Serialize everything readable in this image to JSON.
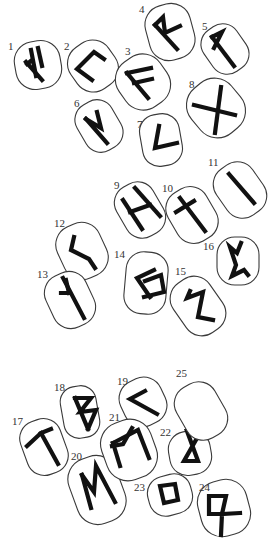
{
  "diagram": {
    "title": "",
    "colors": {
      "background": "#ffffff",
      "outline": "#3a3a3a",
      "rune": "#111111",
      "label": "#333333"
    },
    "stones": [
      {
        "number": "1",
        "rune": "ansuz-variant",
        "cx": 38,
        "cy": 65,
        "rx": 23,
        "ry": 24,
        "rot": -10,
        "label": {
          "x": 8,
          "y": 50
        },
        "paths": [
          "M26,62 L42,80",
          "M31,50 L36,76 M32,60 L27,64",
          "M38,48 L42,66"
        ]
      },
      {
        "number": "2",
        "rune": "uruz",
        "cx": 93,
        "cy": 66,
        "rx": 23,
        "ry": 25,
        "rot": -35,
        "label": {
          "x": 64,
          "y": 50
        },
        "paths": [
          "M104,59 L94,52 L77,69 L92,80"
        ]
      },
      {
        "number": "3",
        "rune": "ansuz",
        "cx": 143,
        "cy": 82,
        "rx": 25,
        "ry": 27,
        "rot": -35,
        "label": {
          "x": 125,
          "y": 55
        },
        "paths": [
          "M127,73 L148,98",
          "M127,73 L151,68",
          "M134,83 L152,79"
        ]
      },
      {
        "number": "4",
        "rune": "raidho",
        "cx": 170,
        "cy": 32,
        "rx": 23,
        "ry": 28,
        "rot": -15,
        "label": {
          "x": 139,
          "y": 13
        },
        "paths": [
          "M155,25 L177,49",
          "M155,25 L163,17 L165,33 L180,26"
        ]
      },
      {
        "number": "5",
        "rune": "wunjo",
        "cx": 225,
        "cy": 49,
        "rx": 20,
        "ry": 25,
        "rot": -35,
        "label": {
          "x": 202,
          "y": 30
        },
        "paths": [
          "M212,37 L234,66",
          "M212,37 L222,32 L214,48"
        ]
      },
      {
        "number": "6",
        "rune": "wunjo-mirrored",
        "cx": 99,
        "cy": 126,
        "rx": 20,
        "ry": 26,
        "rot": -30,
        "label": {
          "x": 74,
          "y": 107
        },
        "paths": [
          "M86,119 L107,143",
          "M86,119 L101,128 L97,112"
        ]
      },
      {
        "number": "7",
        "rune": "kenaz",
        "cx": 161,
        "cy": 140,
        "rx": 20,
        "ry": 26,
        "rot": -10,
        "label": {
          "x": 137,
          "y": 128
        },
        "paths": [
          "M159,126 L155,148 L177,143"
        ]
      },
      {
        "number": "8",
        "rune": "gebo",
        "cx": 216,
        "cy": 108,
        "rx": 26,
        "ry": 29,
        "rot": -40,
        "label": {
          "x": 189,
          "y": 88
        },
        "paths": [
          "M194,105 L235,115",
          "M221,87 L215,133"
        ]
      },
      {
        "number": "9",
        "rune": "hagalaz",
        "cx": 140,
        "cy": 210,
        "rx": 21,
        "ry": 28,
        "rot": -30,
        "label": {
          "x": 114,
          "y": 189
        },
        "paths": [
          "M123,200 L142,229",
          "M135,188 L160,216",
          "M130,212 L150,205"
        ]
      },
      {
        "number": "10",
        "rune": "naudiz",
        "cx": 192,
        "cy": 215,
        "rx": 22,
        "ry": 28,
        "rot": -30,
        "label": {
          "x": 162,
          "y": 192
        },
        "paths": [
          "M180,198 L205,231",
          "M176,212 L194,201"
        ]
      },
      {
        "number": "11",
        "rune": "isa",
        "cx": 240,
        "cy": 190,
        "rx": 22,
        "ry": 28,
        "rot": -35,
        "label": {
          "x": 208,
          "y": 166
        },
        "paths": [
          "M229,174 L254,203"
        ]
      },
      {
        "number": "12",
        "rune": "jera-variant",
        "cx": 82,
        "cy": 251,
        "rx": 23,
        "ry": 28,
        "rot": -25,
        "label": {
          "x": 54,
          "y": 227
        },
        "paths": [
          "M74,237 L71,250 L89,259 L95,268"
        ]
      },
      {
        "number": "13",
        "rune": "algiz",
        "cx": 70,
        "cy": 300,
        "rx": 22,
        "ry": 28,
        "rot": -25,
        "label": {
          "x": 37,
          "y": 278
        },
        "paths": [
          "M63,278 L84,318",
          "M61,293 L69,293 M69,293 L66,280"
        ]
      },
      {
        "number": "14",
        "rune": "sowilo",
        "cx": 146,
        "cy": 283,
        "rx": 21,
        "ry": 31,
        "rot": 5,
        "label": {
          "x": 114,
          "y": 258
        },
        "paths": [
          "M154,270 L137,278 L150,297",
          "M145,281 L161,275 L164,292 L144,297"
        ]
      },
      {
        "number": "15",
        "rune": "sowilo-variant",
        "cx": 198,
        "cy": 306,
        "rx": 22,
        "ry": 30,
        "rot": -35,
        "label": {
          "x": 175,
          "y": 275
        },
        "paths": [
          "M190,291 L187,298 L203,292 L198,317 L213,320"
        ]
      },
      {
        "number": "16",
        "rune": "perthro-variant",
        "cx": 238,
        "cy": 261,
        "rx": 21,
        "ry": 24,
        "rot": 0,
        "label": {
          "x": 203,
          "y": 250
        },
        "paths": [
          "M241,243 L237,253 L230,247 L236,265 L232,276 L244,270 L248,275"
        ]
      },
      {
        "number": "17",
        "rune": "tiwaz",
        "cx": 44,
        "cy": 447,
        "rx": 21,
        "ry": 28,
        "rot": -20,
        "label": {
          "x": 12,
          "y": 425
        },
        "paths": [
          "M41,433 L58,464",
          "M27,446 L41,433 L51,429"
        ]
      },
      {
        "number": "18",
        "rune": "berkano",
        "cx": 80,
        "cy": 412,
        "rx": 18,
        "ry": 26,
        "rot": -10,
        "label": {
          "x": 54,
          "y": 391
        },
        "paths": [
          "M75,398 L88,429",
          "M75,398 L91,398 L80,412 L96,410 L88,429"
        ]
      },
      {
        "number": "19",
        "rune": "kenaz",
        "cx": 143,
        "cy": 402,
        "rx": 22,
        "ry": 24,
        "rot": -25,
        "label": {
          "x": 117,
          "y": 385
        },
        "paths": [
          "M145,391 L130,399 L157,414"
        ]
      },
      {
        "number": "20",
        "rune": "mannaz",
        "cx": 97,
        "cy": 490,
        "rx": 25,
        "ry": 34,
        "rot": -20,
        "label": {
          "x": 71,
          "y": 460
        },
        "paths": [
          "M82,475 L91,508",
          "M82,475 L94,492 L96,466 L115,502"
        ]
      },
      {
        "number": "21",
        "rune": "mannaz-variant",
        "cx": 129,
        "cy": 450,
        "rx": 26,
        "ry": 30,
        "rot": -20,
        "label": {
          "x": 109,
          "y": 421
        },
        "paths": [
          "M113,443 L120,466",
          "M113,443 L138,430 L149,458",
          "M112,446 L123,444 L132,428"
        ]
      },
      {
        "number": "22",
        "rune": "dagaz-variant",
        "cx": 190,
        "cy": 453,
        "rx": 21,
        "ry": 22,
        "rot": -10,
        "label": {
          "x": 160,
          "y": 436
        },
        "paths": [
          "M187,431 L201,431 L184,461 L198,461 Z"
        ]
      },
      {
        "number": "23",
        "rune": "ingwaz",
        "cx": 170,
        "cy": 495,
        "rx": 22,
        "ry": 20,
        "rot": -15,
        "label": {
          "x": 134,
          "y": 491
        },
        "paths": [
          "M160,486 L175,484 L178,500 L164,503 Z"
        ]
      },
      {
        "number": "24",
        "rune": "othala-variant",
        "cx": 224,
        "cy": 508,
        "rx": 25,
        "ry": 28,
        "rot": -15,
        "label": {
          "x": 199,
          "y": 491
        },
        "paths": [
          "M209,496 L209,514 L222,514 L226,496 Z",
          "M222,514 L240,513 M222,514 L221,535"
        ]
      },
      {
        "number": "25",
        "rune": "blank",
        "cx": 201,
        "cy": 411,
        "rx": 22,
        "ry": 29,
        "rot": -30,
        "label": {
          "x": 176,
          "y": 377
        },
        "paths": []
      }
    ]
  }
}
